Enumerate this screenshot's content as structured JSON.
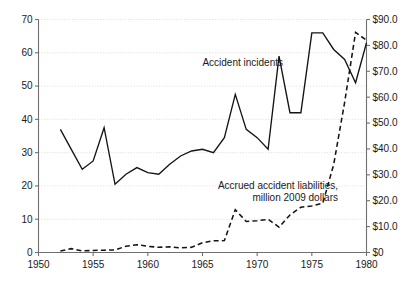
{
  "chart_data": {
    "type": "line",
    "title": "",
    "xlabel": "",
    "ylabel": "",
    "grid": true,
    "legend_position": "inline-annotations",
    "xlim": [
      1950,
      1980
    ],
    "x_ticks": [
      "1950",
      "1955",
      "1960",
      "1965",
      "1970",
      "1975",
      "1980"
    ],
    "x_tick_values": [
      1950,
      1955,
      1960,
      1965,
      1970,
      1975,
      1980
    ],
    "left_axis": {
      "label": "",
      "ylim": [
        0,
        70
      ],
      "ticks": [
        "0",
        "10",
        "20",
        "30",
        "40",
        "50",
        "60",
        "70"
      ],
      "tick_values": [
        0,
        10,
        20,
        30,
        40,
        50,
        60,
        70
      ]
    },
    "right_axis": {
      "label": "",
      "ylim": [
        0,
        90
      ],
      "ticks": [
        "$0",
        "$10.0",
        "$20.0",
        "$30.0",
        "$40.0",
        "$50.0",
        "$60.0",
        "$70.0",
        "$80.0",
        "$90.0"
      ],
      "tick_values": [
        0,
        10,
        20,
        30,
        40,
        50,
        60,
        70,
        80,
        90
      ]
    },
    "series": [
      {
        "name": "Accident incidents",
        "axis": "left",
        "style": "solid",
        "annotation": "Accident incidents",
        "x": [
          1952,
          1953,
          1954,
          1955,
          1956,
          1957,
          1958,
          1959,
          1960,
          1961,
          1962,
          1963,
          1964,
          1965,
          1966,
          1967,
          1968,
          1969,
          1970,
          1971,
          1972,
          1973,
          1974,
          1975,
          1976,
          1977,
          1978,
          1979,
          1980
        ],
        "values": [
          37,
          31,
          25,
          27.5,
          37.5,
          20.5,
          23.5,
          25.5,
          24,
          23.5,
          26.5,
          29,
          30.5,
          31,
          30,
          34.5,
          47.5,
          37,
          34.5,
          31,
          59,
          42,
          42,
          66,
          66,
          61,
          58,
          51,
          63
        ]
      },
      {
        "name": "Accrued accident liabilities, million 2009 dollars",
        "axis": "right",
        "style": "dashed",
        "annotation_line_1": "Accrued accident liabilities,",
        "annotation_line_2": "million 2009 dollars",
        "x": [
          1952,
          1953,
          1954,
          1955,
          1956,
          1957,
          1958,
          1959,
          1960,
          1961,
          1962,
          1963,
          1964,
          1965,
          1966,
          1967,
          1968,
          1969,
          1970,
          1971,
          1972,
          1973,
          1974,
          1975,
          1976,
          1977,
          1978,
          1979,
          1980
        ],
        "values": [
          0.6,
          1.5,
          0.6,
          0.8,
          0.9,
          1.0,
          2.4,
          3.0,
          2.4,
          2.0,
          2.2,
          1.8,
          2.0,
          3.8,
          4.5,
          4.6,
          16.5,
          12.0,
          12.3,
          12.8,
          9.8,
          14.5,
          17.5,
          18.0,
          19.0,
          34.0,
          58.0,
          85.0,
          82.0
        ]
      }
    ]
  }
}
